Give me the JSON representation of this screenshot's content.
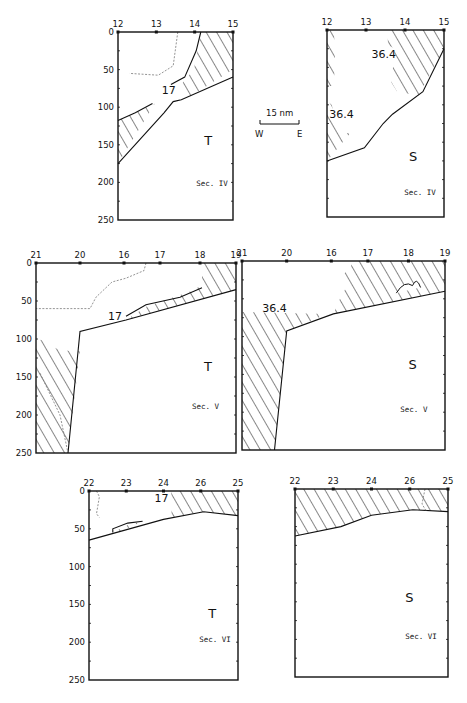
{
  "chart_data": [
    {
      "type": "section-contour",
      "section": "Sec. IV",
      "variable": "T",
      "x_ticks": [
        "12",
        "13",
        "14",
        "15"
      ],
      "y_ticks": [
        "0",
        "50",
        "100",
        "150",
        "200",
        "250"
      ],
      "ylim": [
        0,
        250
      ],
      "contour_label": "17",
      "frame": {
        "x": 118,
        "y": 32,
        "w": 115,
        "h": 188
      },
      "hatched": [
        "M 0.72 0 L 1 0 L 1 0.2 L 0.61 0.35 L 0.52 0.3 L 0.66 0.2 Z",
        "M 0 0.47 L 0.32 0.38 L 0 0.7 Z"
      ],
      "lines": [
        "M 1 0.24 L 0.55 0.36 L 0.48 0.37 L 0.4 0.43 L 0 0.7",
        "M 0.46 0.28 L 0.58 0.24 L 0.68 0.1 L 0.72 0",
        "M 0 0.47 L 0.15 0.43 L 0.3 0.38"
      ],
      "dashed": [
        "M 0.52 0 L 0.48 0.18 L 0.35 0.23 L 0.1 0.22"
      ],
      "label_pos": [
        0.38,
        0.33
      ],
      "var_pos": [
        0.75,
        0.6
      ],
      "sec_pos": [
        0.68,
        0.82
      ]
    },
    {
      "type": "section-contour",
      "section": "Sec. IV",
      "variable": "S",
      "x_ticks": [
        "12",
        "13",
        "14",
        "15"
      ],
      "y_ticks": [],
      "ylim": [
        0,
        250
      ],
      "contour_label": "36.4",
      "contour_label_2": "36.4",
      "frame": {
        "x": 327,
        "y": 30,
        "w": 117,
        "h": 187
      },
      "hatched": [
        "M 0.52 0 L 1 0 L 1 0.1 L 0.78 0.35 L 0.6 0.33 L 0.55 0.28 L 0.58 0.1 L 0.52 0.08 Z",
        "M 0 0 L 0.06 0 L 0.07 0.2 L 0.05 0.3 L 0 0.3 Z",
        "M 0 0.38 L 0.04 0.4 L 0.1 0.55 L 0.2 0.55 L 0 0.7 Z"
      ],
      "lines": [
        "M 1 0.1 L 0.82 0.33 L 0.56 0.45 L 0.48 0.5 L 0.32 0.63 L 0 0.7"
      ],
      "dashed": [],
      "label_pos": [
        0.38,
        0.15
      ],
      "label2_pos": [
        0.02,
        0.47
      ],
      "var_pos": [
        0.7,
        0.7
      ],
      "sec_pos": [
        0.66,
        0.88
      ]
    },
    {
      "type": "section-contour",
      "section": "Sec. V",
      "variable": "T",
      "x_ticks": [
        "21",
        "20",
        "16",
        "17",
        "18",
        "19"
      ],
      "x_tick_pos": [
        0,
        0.22,
        0.44,
        0.62,
        0.82,
        1
      ],
      "y_ticks": [
        "0",
        "50",
        "100",
        "150",
        "200",
        "250"
      ],
      "ylim": [
        0,
        250
      ],
      "contour_label": "17",
      "frame": {
        "x": 36,
        "y": 263,
        "w": 200,
        "h": 190
      },
      "hatched": [
        "M 0.83 0 L 1 0 L 1 0.14 L 0.45 0.3 L 0.55 0.23 L 0.8 0.14 L 0.83 0.1 Z",
        "M 0 0.4 L 0.05 0.41 L 0.1 0.45 L 0.2 0.47 L 0.22 0.46 L 0.16 1 L 0 1 Z"
      ],
      "lines": [
        "M 1 0.14 L 0.45 0.3 L 0.22 0.36 L 0.16 1",
        "M 0.45 0.28 L 0.55 0.22 L 0.72 0.18 L 0.83 0.13"
      ],
      "dashed": [
        "M 0.55 0 L 0.54 0.04 L 0.45 0.08 L 0.38 0.1 L 0.3 0.18 L 0.27 0.24 L 0.23 0.24 L 0 0.24",
        "M 0.02 0.58 L 0.12 0.8 L 0.16 1"
      ],
      "label_pos": [
        0.36,
        0.3
      ],
      "var_pos": [
        0.84,
        0.57
      ],
      "sec_pos": [
        0.78,
        0.77
      ]
    },
    {
      "type": "section-contour",
      "section": "Sec. V",
      "variable": "S",
      "x_ticks": [
        "21",
        "20",
        "16",
        "17",
        "18",
        "19"
      ],
      "x_tick_pos": [
        0,
        0.22,
        0.44,
        0.62,
        0.82,
        1
      ],
      "y_ticks": [],
      "ylim": [
        0,
        250
      ],
      "contour_label": "36.4",
      "frame": {
        "x": 242,
        "y": 261,
        "w": 203,
        "h": 189
      },
      "hatched": [
        "M 0.55 0 L 1 0 L 1 0.16 L 0.45 0.28 L 0.49 0.18 L 0.52 0.13 L 0.49 0.08 L 0.53 0.04 Z",
        "M 0 0.27 L 0.42 0.28 L 0.22 0.37 L 0.16 1 L 0 1 Z"
      ],
      "lines": [
        "M 1 0.16 L 0.45 0.28 L 0.22 0.37 L 0.16 1"
      ],
      "bumps": [
        "M 0.76 0.17 Q 0.8 0.1 0.84 0.13 Q 0.86 0.08 0.88 0.14"
      ],
      "dashed": [],
      "label_pos": [
        0.1,
        0.27
      ],
      "var_pos": [
        0.82,
        0.57
      ],
      "sec_pos": [
        0.78,
        0.8
      ]
    },
    {
      "type": "section-contour",
      "section": "Sec. VI",
      "variable": "T",
      "x_ticks": [
        "22",
        "23",
        "24",
        "26",
        "25"
      ],
      "y_ticks": [
        "0",
        "50",
        "100",
        "150",
        "200",
        "250"
      ],
      "ylim": [
        0,
        250
      ],
      "contour_label": "17",
      "frame": {
        "x": 89,
        "y": 491,
        "w": 149,
        "h": 189
      },
      "hatched": [
        "M 0.55 0 L 1 0 L 1 0.13 L 0.77 0.11 L 0.55 0.14 L 0.56 0.07 Z",
        "M 0.16 0.22 L 0.26 0.18 L 0.36 0.16 L 0.2 0.22 Z"
      ],
      "lines": [
        "M 1 0.13 L 0.77 0.11 L 0.5 0.15 L 0 0.26",
        "M 0.16 0.22 L 0.16 0.2 L 0.26 0.17 L 0.36 0.16"
      ],
      "dashed": [
        "M 0.05 0 L 0.07 0.03 L 0.05 0.12 L 0.07 0.14"
      ],
      "label_pos": [
        0.44,
        0.06
      ],
      "var_pos": [
        0.8,
        0.67
      ],
      "sec_pos": [
        0.74,
        0.8
      ]
    },
    {
      "type": "section-contour",
      "section": "Sec. VI",
      "variable": "S",
      "x_ticks": [
        "22",
        "23",
        "24",
        "26",
        "25"
      ],
      "y_ticks": [],
      "ylim": [
        0,
        250
      ],
      "contour_label": "",
      "frame": {
        "x": 295,
        "y": 489,
        "w": 153,
        "h": 188
      },
      "hatched": [
        "M 0 0 L 1 0 L 1 0.12 L 0.77 0.11 L 0.5 0.14 L 0.3 0.2 L 0 0.25 Z"
      ],
      "lines": [
        "M 1 0.12 L 0.77 0.11 L 0.5 0.14 L 0.3 0.2 L 0 0.25"
      ],
      "dashed": [
        "M 0.85 0 L 0.83 0.08 L 0.86 0.12"
      ],
      "label_pos": [
        0,
        0
      ],
      "var_pos": [
        0.72,
        0.6
      ],
      "sec_pos": [
        0.72,
        0.8
      ]
    }
  ],
  "scale_bar": {
    "label": "15 nm",
    "left": "W",
    "right": "E"
  }
}
